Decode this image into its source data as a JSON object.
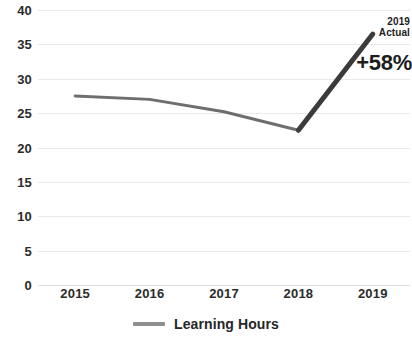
{
  "chart_data": {
    "type": "line",
    "title": "",
    "xlabel": "",
    "ylabel": "",
    "categories": [
      "2015",
      "2016",
      "2017",
      "2018",
      "2019"
    ],
    "series": [
      {
        "name": "Learning Hours",
        "values": [
          27.5,
          27.0,
          25.2,
          22.5,
          36.5
        ],
        "color": "#6e6e6e"
      }
    ],
    "ylim": [
      0,
      40
    ],
    "y_ticks": [
      0,
      5,
      10,
      15,
      20,
      25,
      30,
      35,
      40
    ],
    "y_tick_labels": [
      "0",
      "5",
      "10",
      "15",
      "20",
      "25",
      "30",
      "35",
      "40"
    ],
    "grid": true,
    "grid_color": "#e9e9e9",
    "legend_position": "bottom",
    "annotations": [
      {
        "name": "actual-callout",
        "text_line_1": "2019",
        "text_line_2": "Actual",
        "target_category": "2019"
      },
      {
        "name": "growth-callout",
        "text": "+58%",
        "target_category": "2019"
      }
    ],
    "highlight_segment": {
      "from": "2018",
      "to": "2019",
      "color": "#3b3b3b"
    }
  },
  "legend": {
    "items": [
      {
        "label": "Learning Hours",
        "color": "#8f8f8f"
      }
    ]
  },
  "colors": {
    "line": "#6e6e6e",
    "highlight_line": "#3b3b3b",
    "grid": "#e9e9e9",
    "text": "#2b2b2b",
    "annotation_text": "#1d1d1d"
  }
}
